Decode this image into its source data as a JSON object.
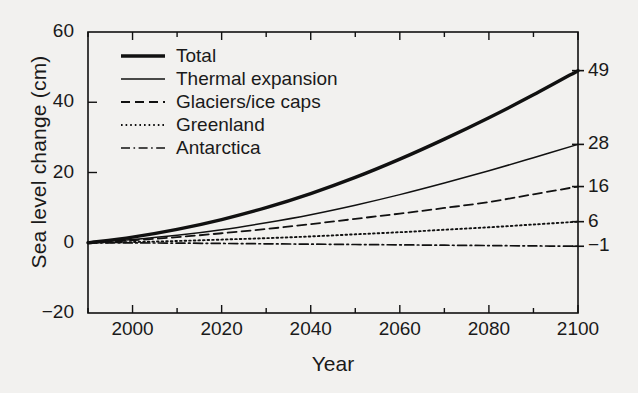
{
  "chart_data": {
    "type": "line",
    "title": "",
    "xlabel": "Year",
    "ylabel": "Sea level change (cm)",
    "xlim": [
      1990,
      2100
    ],
    "ylim": [
      -20,
      60
    ],
    "xticks": [
      2000,
      2020,
      2040,
      2060,
      2080,
      2100
    ],
    "yticks": [
      -20,
      0,
      20,
      40,
      60
    ],
    "xtick_labels": [
      "2000",
      "2020",
      "2040",
      "2060",
      "2080",
      "2100"
    ],
    "ytick_labels": [
      "-20",
      "0",
      "20",
      "40",
      "60"
    ],
    "minor_xtick_interval": 10,
    "grid": false,
    "legend_position": "upper-left-inside",
    "x": [
      1990,
      2000,
      2010,
      2020,
      2030,
      2040,
      2050,
      2060,
      2070,
      2080,
      2090,
      2100
    ],
    "series": [
      {
        "name": "Total",
        "style": "solid-thick",
        "end_label": "49",
        "values": [
          0,
          1.6,
          3.8,
          6.6,
          10.0,
          14.0,
          18.6,
          23.8,
          29.5,
          35.6,
          42.1,
          49.0
        ]
      },
      {
        "name": "Thermal expansion",
        "style": "solid-thin",
        "end_label": "28",
        "values": [
          0,
          0.9,
          2.1,
          3.7,
          5.7,
          8.0,
          10.7,
          13.7,
          17.0,
          20.5,
          24.2,
          28.0
        ]
      },
      {
        "name": "Glaciers/ice caps",
        "style": "dashed",
        "end_label": "16",
        "values": [
          0,
          0.7,
          1.6,
          2.7,
          3.9,
          5.3,
          6.8,
          8.3,
          9.9,
          11.6,
          13.8,
          16.0
        ]
      },
      {
        "name": "Greenland",
        "style": "dotted",
        "end_label": "6",
        "values": [
          0,
          0.2,
          0.5,
          0.9,
          1.3,
          1.8,
          2.4,
          3.0,
          3.7,
          4.4,
          5.2,
          6.0
        ]
      },
      {
        "name": "Antarctica",
        "style": "dash-dot",
        "end_label": "-1",
        "values": [
          0,
          -0.05,
          -0.1,
          -0.2,
          -0.3,
          -0.4,
          -0.5,
          -0.6,
          -0.7,
          -0.8,
          -0.9,
          -1.0
        ]
      }
    ],
    "colors": {
      "line": "#111111",
      "axis": "#111111",
      "background": "#f2f1ef"
    }
  }
}
